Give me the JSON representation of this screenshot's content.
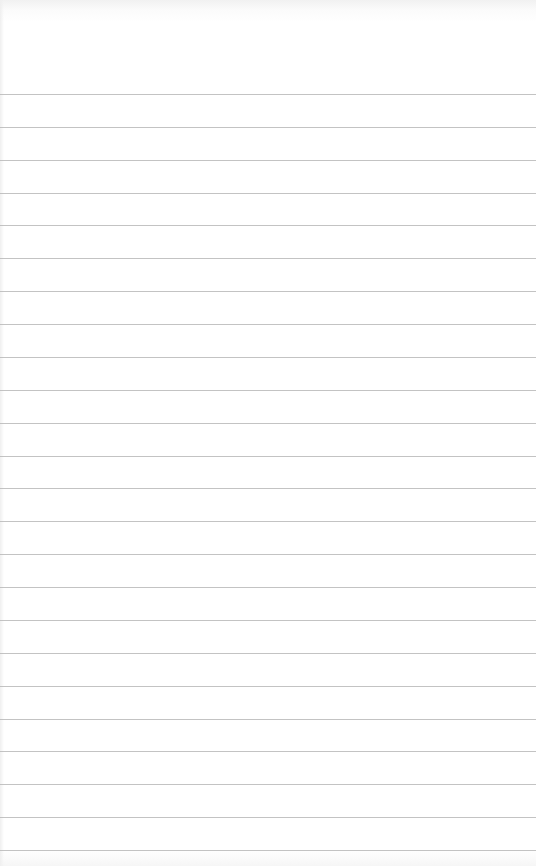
{
  "page": {
    "type": "lined-notepad-paper",
    "background_color": "#ffffff",
    "rule_color": "#b9b9b9",
    "rule_count": 24,
    "first_rule_y": 94,
    "rule_spacing": 32.87,
    "text": ""
  }
}
